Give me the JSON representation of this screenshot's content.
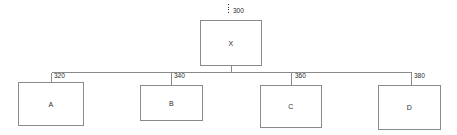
{
  "diagram": {
    "type": "hierarchy-tree",
    "background_color": "#ffffff",
    "line_color": "#8a8a8a",
    "text_color": "#2b2b2b",
    "root": {
      "label": "X",
      "reference_numeral": "300",
      "leader_style": "dotted-vertical"
    },
    "children": [
      {
        "label": "A",
        "reference_numeral": "320"
      },
      {
        "label": "B",
        "reference_numeral": "340"
      },
      {
        "label": "C",
        "reference_numeral": "360"
      },
      {
        "label": "D",
        "reference_numeral": "380"
      }
    ]
  }
}
